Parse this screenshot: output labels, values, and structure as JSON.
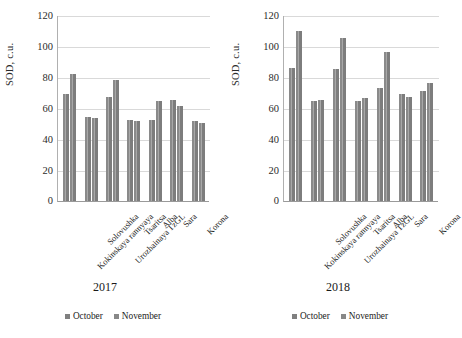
{
  "chart_data": [
    {
      "type": "bar",
      "title": "2017",
      "xlabel": "",
      "ylabel": "SOD, c.u.",
      "ylim": [
        0,
        120
      ],
      "yticks": [
        0,
        20,
        40,
        60,
        80,
        100,
        120
      ],
      "grid": true,
      "legend_position": "bottom",
      "categories": [
        "Kokinskaya rannyaya",
        "Solovushka",
        "Urozhainaya TzGL",
        "Tsaritsa",
        "Alba",
        "Sara",
        "Korona"
      ],
      "series": [
        {
          "name": "October",
          "values": [
            70,
            55,
            68,
            53,
            53,
            66,
            52
          ]
        },
        {
          "name": "November",
          "values": [
            83,
            54,
            79,
            52,
            65,
            62,
            51
          ]
        }
      ]
    },
    {
      "type": "bar",
      "title": "2018",
      "xlabel": "",
      "ylabel": "SOD, c.u.",
      "ylim": [
        0,
        120
      ],
      "yticks": [
        0,
        20,
        40,
        60,
        80,
        100,
        120
      ],
      "grid": true,
      "legend_position": "bottom",
      "categories": [
        "Kokinskaya rannyaya",
        "Solovushka",
        "Urozhainaya TzGL",
        "Tsaritsa",
        "Alba",
        "Sara",
        "Korona"
      ],
      "series": [
        {
          "name": "October",
          "values": [
            87,
            65,
            86,
            65,
            74,
            70,
            72
          ]
        },
        {
          "name": "November",
          "values": [
            111,
            66,
            106,
            67,
            97,
            68,
            77
          ]
        }
      ]
    }
  ],
  "axis": {
    "ylabel": "SOD, c.u.",
    "tick_120": "120",
    "tick_100": "100",
    "tick_80": "80",
    "tick_60": "60",
    "tick_40": "40",
    "tick_20": "20",
    "tick_0": "0"
  },
  "legend": {
    "october": "October",
    "november": "November"
  },
  "left_panel": {
    "year": "2017",
    "cat0": "Kokinskaya rannyaya",
    "cat1": "Solovushka",
    "cat2": "Urozhainaya TzGL",
    "cat3": "Tsaritsa",
    "cat4": "Alba",
    "cat5": "Sara",
    "cat6": "Korona"
  },
  "right_panel": {
    "year": "2018",
    "cat0": "Kokinskaya rannyaya",
    "cat1": "Solovushka",
    "cat2": "Urozhainaya TzGL",
    "cat3": "Tsaritsa",
    "cat4": "Alba",
    "cat5": "Sara",
    "cat6": "Korona"
  },
  "colors": {
    "bar": "#808080",
    "grid": "#d9d9d9",
    "axis": "#9a9a9a"
  }
}
